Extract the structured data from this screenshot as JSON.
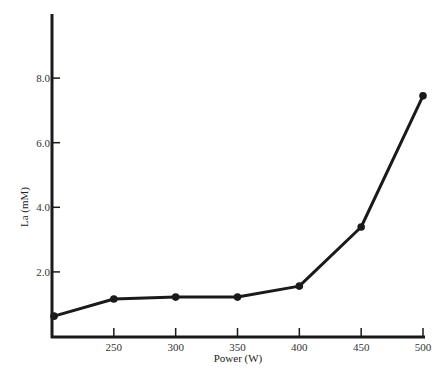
{
  "chart_data": {
    "type": "line",
    "title": "",
    "xlabel": "Power (W)",
    "ylabel": "La (mM)",
    "x": [
      200,
      250,
      300,
      350,
      400,
      450,
      500
    ],
    "series": [
      {
        "name": "La",
        "values": [
          0.63,
          1.16,
          1.22,
          1.22,
          1.56,
          3.39,
          7.45
        ]
      }
    ],
    "x_ticks": [
      "250",
      "300",
      "350",
      "400",
      "450",
      "500"
    ],
    "y_ticks": [
      "2.0",
      "4.0",
      "6.0",
      "8.0"
    ],
    "xlim": [
      200,
      500
    ],
    "ylim": [
      0,
      10
    ],
    "grid": false,
    "legend": "none",
    "colors": {
      "line": "#1a1a1a",
      "axis": "#1a1a1a"
    }
  }
}
